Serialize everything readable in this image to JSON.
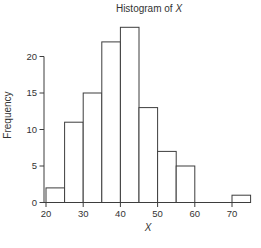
{
  "chart_data": {
    "type": "bar",
    "subtype": "histogram",
    "title": "Histogram of X",
    "title_parts": {
      "prefix": "Histogram of ",
      "variable": "X"
    },
    "xlabel": "X",
    "ylabel": "Frequency",
    "bin_edges": [
      20,
      25,
      30,
      35,
      40,
      45,
      50,
      55,
      60,
      65,
      70,
      75
    ],
    "frequencies": [
      2,
      11,
      15,
      22,
      24,
      13,
      7,
      5,
      0,
      0,
      1
    ],
    "x_ticks": [
      20,
      30,
      40,
      50,
      60,
      70
    ],
    "y_ticks": [
      0,
      5,
      10,
      15,
      20
    ],
    "xlim": [
      20,
      75
    ],
    "ylim": [
      0,
      24
    ],
    "total_count": 100,
    "grid": false,
    "legend": "none",
    "bar_fill": "#ffffff",
    "line_color": "#3d3d3d",
    "text_color": "#333333",
    "background": "#ffffff"
  }
}
